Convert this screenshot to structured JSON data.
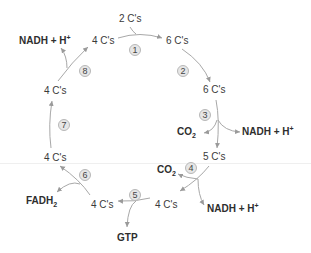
{
  "diagram": {
    "type": "citric-acid-cycle",
    "colors": {
      "arrow": "#9a9a9a",
      "text": "#3a3a3a",
      "step_bg": "#e6e6e6",
      "step_border": "#b8b8b8"
    },
    "input": {
      "label": "2 C's"
    },
    "intermediates": [
      {
        "id": "c4_top",
        "label": "4 C's"
      },
      {
        "id": "c6_top",
        "label": "6 C's"
      },
      {
        "id": "c6_right",
        "label": "6 C's"
      },
      {
        "id": "c5",
        "label": "5 C's"
      },
      {
        "id": "c4_bottom_right",
        "label": "4 C's"
      },
      {
        "id": "c4_bottom_left",
        "label": "4 C's"
      },
      {
        "id": "c4_left_lower",
        "label": "4 C's"
      },
      {
        "id": "c4_left_upper",
        "label": "4 C's"
      }
    ],
    "steps": [
      "1",
      "2",
      "3",
      "4",
      "5",
      "6",
      "7",
      "8"
    ],
    "products": {
      "step3_co2": {
        "main": "CO",
        "sub": "2"
      },
      "step3_nadh": {
        "main": "NADH + H",
        "sup": "+"
      },
      "step4_co2": {
        "main": "CO",
        "sub": "2"
      },
      "step4_nadh": {
        "main": "NADH + H",
        "sup": "+"
      },
      "step5_gtp": {
        "main": "GTP"
      },
      "step6_fadh2": {
        "main": "FADH",
        "sub": "2"
      },
      "step8_nadh": {
        "main": "NADH + H",
        "sup": "+"
      }
    }
  }
}
